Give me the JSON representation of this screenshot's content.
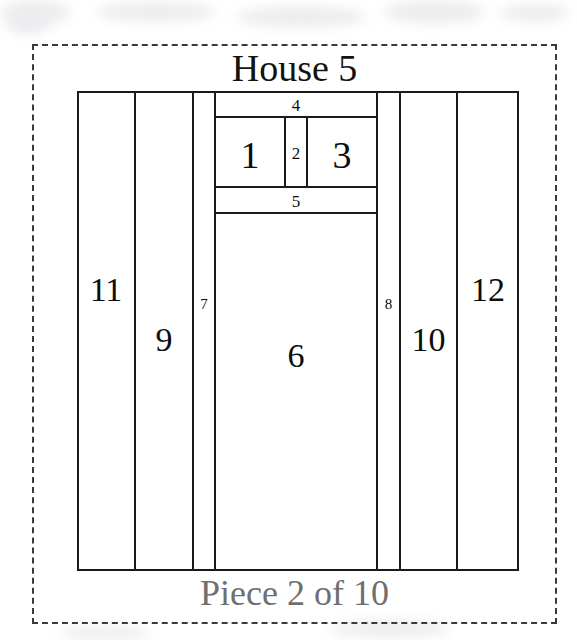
{
  "title": "House 5",
  "footer": "Piece 2 of 10",
  "colors": {
    "line": "#1a1a1a",
    "dashed_frame": "#3a3a3a",
    "title_text": "#121212",
    "footer_text": "#6f6f6f",
    "background": "#ffffff"
  },
  "floorplan": {
    "outer_box": {
      "x": 77,
      "y": 91,
      "w": 442,
      "h": 480
    },
    "frame": {
      "x": 32,
      "y": 44,
      "w": 525,
      "h": 580,
      "style": "dashed"
    },
    "regions": [
      {
        "id": "1",
        "label": "1",
        "x": 215,
        "y": 117,
        "w": 70,
        "h": 70,
        "size": "lbl-xl",
        "label_top": 18
      },
      {
        "id": "2",
        "label": "2",
        "x": 285,
        "y": 117,
        "w": 22,
        "h": 70,
        "size": "lbl-sm",
        "label_top": 27
      },
      {
        "id": "3",
        "label": "3",
        "x": 307,
        "y": 117,
        "w": 70,
        "h": 70,
        "size": "lbl-xl",
        "label_top": 18
      },
      {
        "id": "4",
        "label": "4",
        "x": 215,
        "y": 91,
        "w": 162,
        "h": 26,
        "size": "lbl-sm",
        "label_top": 5
      },
      {
        "id": "5",
        "label": "5",
        "x": 215,
        "y": 187,
        "w": 162,
        "h": 26,
        "size": "lbl-sm",
        "label_top": 5
      },
      {
        "id": "6",
        "label": "6",
        "x": 215,
        "y": 213,
        "w": 162,
        "h": 358,
        "size": "lbl-lg",
        "label_top": 125
      },
      {
        "id": "7",
        "label": "7",
        "x": 193,
        "y": 91,
        "w": 22,
        "h": 480,
        "size": "lbl-xs",
        "label_top": 205
      },
      {
        "id": "8",
        "label": "8",
        "x": 377,
        "y": 91,
        "w": 23,
        "h": 480,
        "size": "lbl-xs",
        "label_top": 205
      },
      {
        "id": "9",
        "label": "9",
        "x": 135,
        "y": 91,
        "w": 58,
        "h": 480,
        "size": "lbl-lg",
        "label_top": 231
      },
      {
        "id": "10",
        "label": "10",
        "x": 400,
        "y": 91,
        "w": 57,
        "h": 480,
        "size": "lbl-lg",
        "label_top": 231
      },
      {
        "id": "11",
        "label": "11",
        "x": 77,
        "y": 91,
        "w": 58,
        "h": 480,
        "size": "lbl-lg",
        "label_top": 181
      },
      {
        "id": "12",
        "label": "12",
        "x": 457,
        "y": 91,
        "w": 62,
        "h": 480,
        "size": "lbl-lg",
        "label_top": 181
      }
    ]
  },
  "background_smudges": [
    {
      "x": 0,
      "y": 0,
      "w": 70,
      "h": 26
    },
    {
      "x": 96,
      "y": 2,
      "w": 120,
      "h": 20
    },
    {
      "x": 236,
      "y": 6,
      "w": 130,
      "h": 22
    },
    {
      "x": 384,
      "y": 0,
      "w": 100,
      "h": 24
    },
    {
      "x": 500,
      "y": 4,
      "w": 70,
      "h": 18
    },
    {
      "x": 6,
      "y": 16,
      "w": 44,
      "h": 18
    },
    {
      "x": 330,
      "y": 620,
      "w": 120,
      "h": 18
    },
    {
      "x": 60,
      "y": 626,
      "w": 90,
      "h": 14
    }
  ]
}
